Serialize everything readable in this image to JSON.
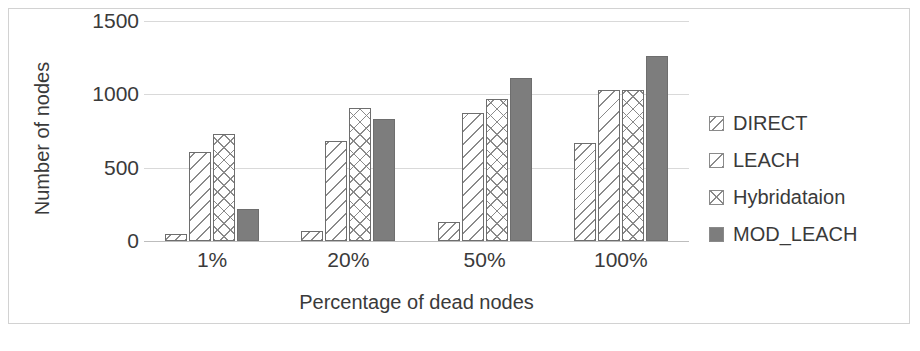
{
  "chart_data": {
    "type": "bar",
    "title": "",
    "subtitle": "",
    "xlabel": "Percentage of dead nodes",
    "ylabel": "Number of nodes",
    "categories": [
      "1%",
      "20%",
      "50%",
      "100%"
    ],
    "series": [
      {
        "name": "DIRECT",
        "values": [
          50,
          70,
          130,
          670
        ],
        "pattern": "diagonal-hatch-fine",
        "swatch_class": "p-direct"
      },
      {
        "name": "LEACH",
        "values": [
          610,
          680,
          870,
          1030
        ],
        "pattern": "diagonal-hatch-wide",
        "swatch_class": "p-leach"
      },
      {
        "name": "Hybridataion",
        "values": [
          730,
          910,
          970,
          1030
        ],
        "pattern": "crosshatch-diamond",
        "swatch_class": "p-hybrid"
      },
      {
        "name": "MOD_LEACH",
        "values": [
          220,
          830,
          1110,
          1260
        ],
        "pattern": "solid",
        "swatch_class": "p-mod"
      }
    ],
    "ylim": [
      0,
      1500
    ],
    "yticks": [
      0,
      500,
      1000,
      1500
    ],
    "ytick_labels": [
      "0",
      "500",
      "1000",
      "1500"
    ],
    "grid": true,
    "grid_axis": "y",
    "legend_position": "right",
    "colors": {
      "bar_outline": "#6e6e6e",
      "pattern_line": "#8a8a8a",
      "solid_fill": "#7d7d7d",
      "gridline": "#d9d9d9",
      "text": "#3a3a3a",
      "frame_border": "#d2d2d2",
      "background": "#ffffff"
    }
  }
}
